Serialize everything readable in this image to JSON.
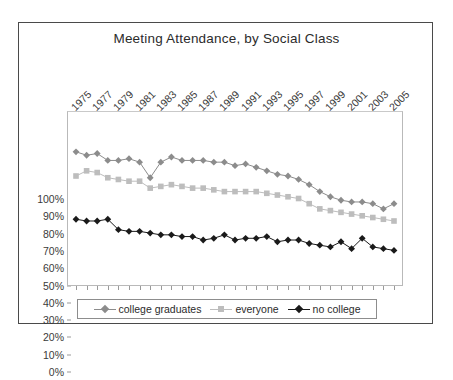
{
  "chart_data": {
    "type": "line",
    "title": "Meeting Attendance, by Social Class",
    "xlabel": "",
    "ylabel": "",
    "ylim": [
      0,
      100
    ],
    "ytick_labels": [
      "0%",
      "10%",
      "20%",
      "30%",
      "40%",
      "50%",
      "60%",
      "70%",
      "80%",
      "90%",
      "100%"
    ],
    "ytick_values": [
      0,
      10,
      20,
      30,
      40,
      50,
      60,
      70,
      80,
      90,
      100
    ],
    "grid": false,
    "legend_position": "bottom",
    "x": [
      1975,
      1976,
      1977,
      1978,
      1979,
      1980,
      1981,
      1982,
      1983,
      1984,
      1985,
      1986,
      1987,
      1988,
      1989,
      1990,
      1991,
      1992,
      1993,
      1994,
      1995,
      1996,
      1997,
      1998,
      1999,
      2000,
      2001,
      2002,
      2003,
      2004,
      2005
    ],
    "xtick_labels": [
      "1975",
      "1977",
      "1979",
      "1981",
      "1983",
      "1985",
      "1987",
      "1989",
      "1991",
      "1993",
      "1995",
      "1997",
      "1999",
      "2001",
      "2003",
      "2005"
    ],
    "xtick_label_values": [
      1975,
      1977,
      1979,
      1981,
      1983,
      1985,
      1987,
      1989,
      1991,
      1993,
      1995,
      1997,
      1999,
      2001,
      2003,
      2005
    ],
    "series": [
      {
        "name": "college graduates",
        "marker": "diamond",
        "color": "#8c8c8c",
        "values": [
          77,
          75,
          76,
          72,
          72,
          73,
          71,
          62,
          71,
          74,
          72,
          72,
          72,
          71,
          71,
          69,
          70,
          68,
          66,
          64,
          63,
          61,
          58,
          54,
          51,
          49,
          48,
          48,
          47,
          44,
          47
        ]
      },
      {
        "name": "everyone",
        "marker": "square",
        "color": "#bdbdbd",
        "values": [
          63,
          66,
          65,
          62,
          61,
          60,
          60,
          56,
          57,
          58,
          57,
          56,
          56,
          55,
          54,
          54,
          54,
          54,
          53,
          52,
          51,
          50,
          47,
          44,
          43,
          42,
          41,
          40,
          39,
          38,
          37
        ]
      },
      {
        "name": "no college",
        "marker": "diamond",
        "color": "#1a1a1a",
        "values": [
          38,
          37,
          37,
          38,
          32,
          31,
          31,
          30,
          29,
          29,
          28,
          28,
          26,
          27,
          29,
          26,
          27,
          27,
          28,
          25,
          26,
          26,
          24,
          23,
          22,
          25,
          21,
          27,
          22,
          21,
          20
        ]
      }
    ]
  },
  "legend": {
    "items": [
      {
        "label": "college graduates"
      },
      {
        "label": "everyone"
      },
      {
        "label": "no college"
      }
    ]
  }
}
